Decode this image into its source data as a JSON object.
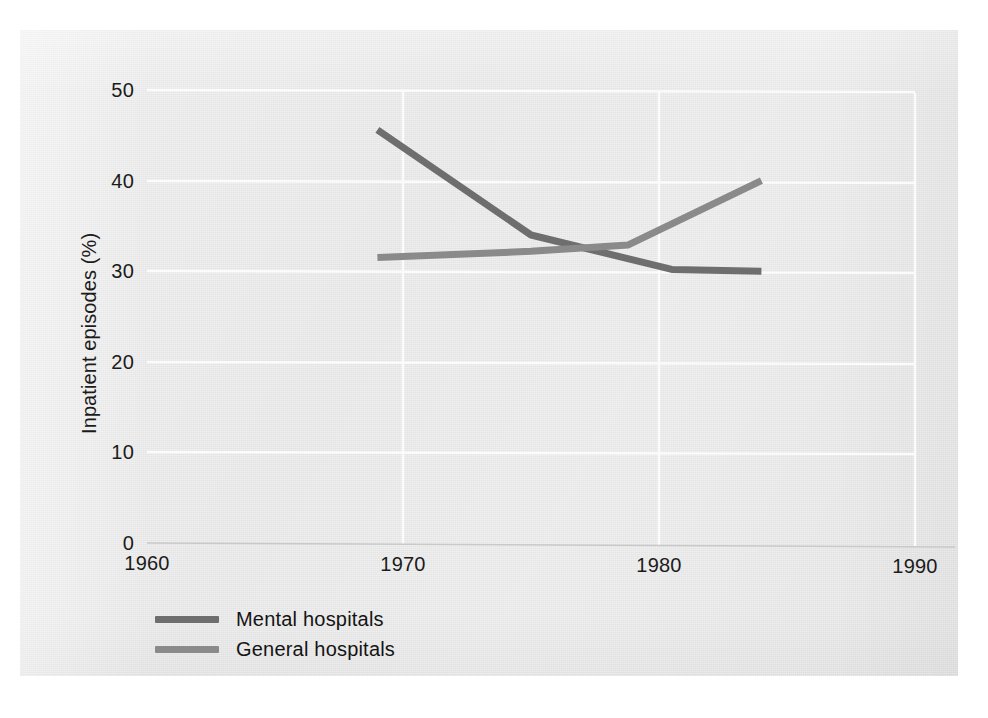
{
  "chart_data": {
    "type": "line",
    "title": "",
    "xlabel": "",
    "ylabel": "Inpatient episodes (%)",
    "xlim": [
      1960,
      1990
    ],
    "ylim": [
      0,
      50
    ],
    "xticks": [
      "1960",
      "1970",
      "1980",
      "1990"
    ],
    "yticks": [
      "0",
      "10",
      "20",
      "30",
      "40",
      "50"
    ],
    "grid": true,
    "legend_position": "below-left",
    "series": [
      {
        "name": "Mental hospitals",
        "color": "#6e6e6e",
        "x": [
          1969,
          1975,
          1980.5,
          1984
        ],
        "values": [
          45.6,
          34.0,
          30.2,
          30.0
        ]
      },
      {
        "name": "General hospitals",
        "color": "#8a8a8a",
        "x": [
          1969,
          1975,
          1978.8,
          1984
        ],
        "values": [
          31.5,
          32.2,
          32.9,
          40.0
        ]
      }
    ]
  },
  "axes": {
    "y_title": "Inpatient episodes (%)",
    "y_ticks": [
      "50",
      "40",
      "30",
      "20",
      "10",
      "0"
    ],
    "x_ticks": [
      "1960",
      "1970",
      "1980",
      "1990"
    ]
  },
  "legend": {
    "items": [
      {
        "label": "Mental hospitals",
        "color": "#6e6e6e"
      },
      {
        "label": "General hospitals",
        "color": "#8a8a8a"
      }
    ]
  }
}
